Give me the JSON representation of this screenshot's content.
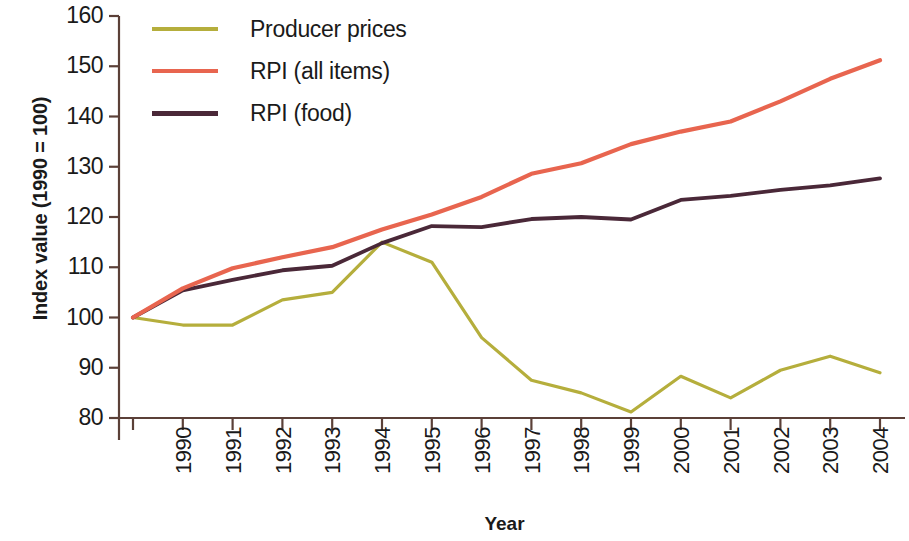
{
  "chart_data": {
    "type": "line",
    "title": "",
    "xlabel": "Year",
    "ylabel": "Index value (1990 = 100)",
    "categories": [
      "1990",
      "1991",
      "1992",
      "1993",
      "1994",
      "1995",
      "1996",
      "1997",
      "1998",
      "1999",
      "2000",
      "2001",
      "2002",
      "2003",
      "2004",
      "2005"
    ],
    "x": [
      1990,
      1991,
      1992,
      1993,
      1994,
      1995,
      1996,
      1997,
      1998,
      1999,
      2000,
      2001,
      2002,
      2003,
      2004,
      2005
    ],
    "xlim": [
      1990,
      2005
    ],
    "ylim": [
      80,
      160
    ],
    "yticks": [
      80,
      90,
      100,
      110,
      120,
      130,
      140,
      150,
      160
    ],
    "grid": false,
    "legend_position": "top-left",
    "series": [
      {
        "name": "Producer prices",
        "color": "#b5ae3c",
        "values": [
          100,
          98.5,
          98.5,
          103.5,
          105,
          115,
          111,
          96,
          87.5,
          85,
          81.2,
          88.3,
          84,
          89.5,
          92.3,
          89
        ]
      },
      {
        "name": "RPI (all items)",
        "color": "#e8654f",
        "values": [
          100,
          105.8,
          109.8,
          112,
          114,
          117.5,
          120.5,
          124,
          128.6,
          130.7,
          134.5,
          137,
          139,
          143,
          147.5,
          151.2
        ]
      },
      {
        "name": "RPI (food)",
        "color": "#4a2838",
        "values": [
          100,
          105.4,
          107.5,
          109.4,
          110.3,
          114.8,
          118.2,
          118,
          119.6,
          120,
          119.5,
          123.4,
          124.2,
          125.4,
          126.3,
          127.7
        ]
      }
    ]
  },
  "legend": {
    "items": [
      {
        "label": "Producer prices",
        "color": "#b5ae3c"
      },
      {
        "label": "RPI (all items)",
        "color": "#e8654f"
      },
      {
        "label": "RPI (food)",
        "color": "#4a2838"
      }
    ]
  },
  "axes": {
    "y_title": "Index value (1990 = 100)",
    "x_title": "Year",
    "y_tick_labels": [
      "160",
      "150",
      "140",
      "130",
      "120",
      "110",
      "100",
      "90",
      "80"
    ],
    "x_tick_labels": [
      "1990",
      "1991",
      "1992",
      "1993",
      "1994",
      "1995",
      "1996",
      "1997",
      "1998",
      "1999",
      "2000",
      "2001",
      "2002",
      "2003",
      "2004",
      "2005"
    ],
    "axis_color": "#5b4038"
  }
}
